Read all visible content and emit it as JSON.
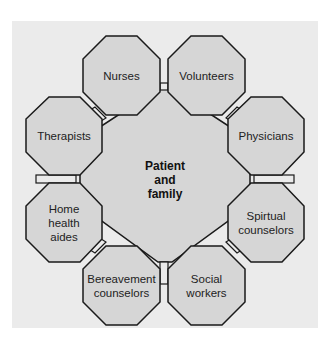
{
  "diagram": {
    "center": {
      "label_lines": [
        "Patient",
        "and",
        "family"
      ]
    },
    "nodes": [
      {
        "id": "nurses",
        "label": "Nurses"
      },
      {
        "id": "volunteers",
        "label": "Volunteers"
      },
      {
        "id": "therapists",
        "label": "Therapists"
      },
      {
        "id": "physicians",
        "label": "Physicians"
      },
      {
        "id": "home-health-aides",
        "label_lines": [
          "Home",
          "health",
          "aides"
        ]
      },
      {
        "id": "spiritual-counselors",
        "label_lines": [
          "Spirtual",
          "counselors"
        ]
      },
      {
        "id": "bereavement-counselors",
        "label_lines": [
          "Bereavement",
          "counselors"
        ]
      },
      {
        "id": "social-workers",
        "label_lines": [
          "Social",
          "workers"
        ]
      }
    ],
    "colors": {
      "panel": "#ebebeb",
      "fill": "#d6d6d6",
      "stroke": "#1a1a1a"
    }
  }
}
